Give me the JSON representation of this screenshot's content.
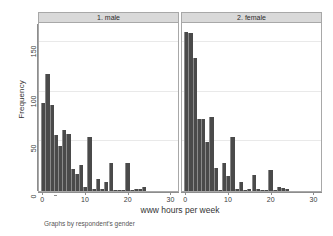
{
  "chart_data": {
    "type": "bar",
    "title": "",
    "subtitle": "",
    "xlabel": "www hours per week",
    "ylabel": "Frequency",
    "note": "Graphs by respondent's gender",
    "grid": true,
    "legend_position": "none",
    "xlim": [
      -1,
      32
    ],
    "ylim": [
      0,
      168
    ],
    "xticks": [
      0,
      10,
      20,
      30
    ],
    "xticklabels": [
      "0",
      "10",
      "20",
      "30"
    ],
    "yticks": [
      0,
      50,
      100,
      150
    ],
    "yticklabels": [
      "0",
      "50",
      "100",
      "150"
    ],
    "bar_color": "#4a4a4a",
    "bin_width": 1,
    "panels": [
      {
        "id": "male",
        "label": "1. male",
        "x": [
          0,
          1,
          2,
          3,
          4,
          5,
          6,
          7,
          8,
          9,
          10,
          11,
          12,
          13,
          14,
          15,
          16,
          17,
          18,
          19,
          20,
          21,
          22,
          23,
          24
        ],
        "values": [
          89,
          118,
          87,
          56,
          45,
          61,
          57,
          22,
          17,
          26,
          4,
          54,
          2,
          12,
          2,
          9,
          28,
          1,
          1,
          1,
          28,
          1,
          2,
          2,
          4
        ]
      },
      {
        "id": "female",
        "label": "2. female",
        "x": [
          0,
          1,
          2,
          3,
          4,
          5,
          6,
          7,
          8,
          9,
          10,
          11,
          12,
          13,
          14,
          15,
          16,
          17,
          18,
          19,
          20,
          21,
          22,
          23,
          24
        ],
        "values": [
          160,
          159,
          134,
          72,
          72,
          49,
          74,
          23,
          1,
          28,
          15,
          54,
          2,
          9,
          1,
          2,
          16,
          2,
          1,
          1,
          21,
          1,
          4,
          3,
          2
        ]
      }
    ]
  }
}
